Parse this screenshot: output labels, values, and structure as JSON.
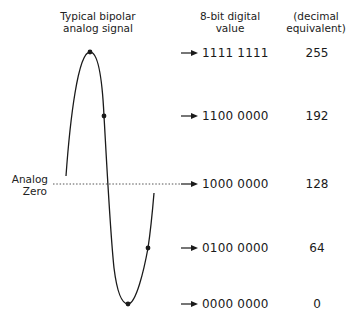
{
  "headers": {
    "signal": [
      "Typical bipolar",
      "analog signal"
    ],
    "digital": [
      "8-bit digital",
      "value"
    ],
    "decimal": [
      "(decimal",
      "equivalent)"
    ]
  },
  "analog_zero": {
    "line1": "Analog",
    "line2": "Zero"
  },
  "levels": [
    {
      "binary": "1111 1111",
      "decimal": "255"
    },
    {
      "binary": "1100 0000",
      "decimal": "192"
    },
    {
      "binary": "1000 0000",
      "decimal": "128"
    },
    {
      "binary": "0100 0000",
      "decimal": "64"
    },
    {
      "binary": "0000 0000",
      "decimal": "0"
    }
  ],
  "colors": {
    "ink": "#1a1a1a",
    "dotted_line": "#555555",
    "background": "#ffffff"
  }
}
